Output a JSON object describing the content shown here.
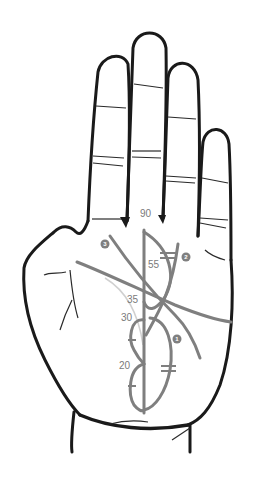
{
  "diagram": {
    "colors": {
      "outline": "#1a1a1a",
      "palm_lines": "#7f7f7f",
      "faint_line": "#cfcfcf",
      "background": "#ffffff"
    },
    "age_labels": [
      {
        "text": "90",
        "x": 140,
        "y": 217
      },
      {
        "text": "55",
        "x": 148,
        "y": 268
      },
      {
        "text": "35",
        "x": 127,
        "y": 303
      },
      {
        "text": "30",
        "x": 121,
        "y": 321
      },
      {
        "text": "20",
        "x": 119,
        "y": 369
      }
    ],
    "line_badges": [
      {
        "text": "1",
        "x": 177,
        "y": 339
      },
      {
        "text": "2",
        "x": 186,
        "y": 257
      },
      {
        "text": "3",
        "x": 105,
        "y": 244
      }
    ]
  }
}
